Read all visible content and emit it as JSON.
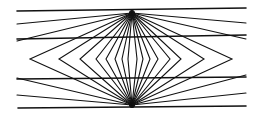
{
  "figure": {
    "background": "#ffffff",
    "stroke_color": "#111111",
    "top_apex": [
      132,
      13
    ],
    "bottom_apex": [
      132,
      105
    ],
    "horizontal_lines": [
      {
        "x1": 17,
        "y1": 11,
        "x2": 246,
        "y2": 8,
        "width": 1.6
      },
      {
        "x1": 17,
        "y1": 39,
        "x2": 246,
        "y2": 35,
        "width": 1.6
      },
      {
        "x1": 17,
        "y1": 79,
        "x2": 246,
        "y2": 77,
        "width": 1.6
      },
      {
        "x1": 18,
        "y1": 108,
        "x2": 246,
        "y2": 106,
        "width": 1.6
      }
    ],
    "top_rays": [
      [
        17,
        24
      ],
      [
        17,
        41
      ],
      [
        246,
        23
      ],
      [
        246,
        39
      ]
    ],
    "bottom_rays": [
      [
        17,
        78
      ],
      [
        17,
        95
      ],
      [
        246,
        75
      ],
      [
        246,
        93
      ]
    ],
    "diamond_mid_y": 59,
    "diamond_left_x": [
      30,
      59,
      80,
      96,
      106,
      115,
      122,
      128
    ],
    "diamond_right_x": [
      137,
      143,
      150,
      158,
      170,
      181,
      204,
      232
    ]
  }
}
